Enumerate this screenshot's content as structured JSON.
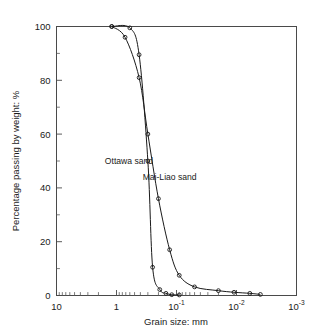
{
  "chart_data": {
    "type": "line",
    "title": "",
    "xlabel": "Grain size: mm",
    "ylabel": "Percentage passing by weight: %",
    "xscale": "log",
    "x_axis_direction": "decreasing",
    "xlim": [
      10,
      0.001
    ],
    "ylim": [
      0,
      100
    ],
    "grid": false,
    "legend": "inline-annotations",
    "x_ticks": [
      {
        "value": 10,
        "label": "10",
        "mantissa": "10",
        "exponent": ""
      },
      {
        "value": 1,
        "label": "1",
        "mantissa": "1",
        "exponent": ""
      },
      {
        "value": 0.1,
        "label": "10-1",
        "mantissa": "10",
        "exponent": "-1"
      },
      {
        "value": 0.01,
        "label": "10-2",
        "mantissa": "10",
        "exponent": "-2"
      },
      {
        "value": 0.001,
        "label": "10-3",
        "mantissa": "10",
        "exponent": "-3"
      }
    ],
    "y_ticks": [
      {
        "value": 0,
        "label": "0"
      },
      {
        "value": 20,
        "label": "20"
      },
      {
        "value": 40,
        "label": "40"
      },
      {
        "value": 60,
        "label": "60"
      },
      {
        "value": 80,
        "label": "80"
      },
      {
        "value": 100,
        "label": "100"
      }
    ],
    "y_minor_ticks": [
      10,
      30,
      50,
      70,
      90
    ],
    "series": [
      {
        "name": "Ottawa sand",
        "label": "Ottawa sand",
        "label_x": 0.62,
        "label_y": 49,
        "marker": "circle",
        "points": [
          {
            "x": 1.2,
            "y": 100
          },
          {
            "x": 0.6,
            "y": 99.5
          },
          {
            "x": 0.42,
            "y": 89.5
          },
          {
            "x": 0.3,
            "y": 50
          },
          {
            "x": 0.25,
            "y": 10.5
          },
          {
            "x": 0.19,
            "y": 2.2
          },
          {
            "x": 0.15,
            "y": 0.8
          },
          {
            "x": 0.12,
            "y": 0.3
          },
          {
            "x": 0.09,
            "y": 0.2
          }
        ]
      },
      {
        "name": "Mai-Liao sand",
        "label": "Mai-Liao sand",
        "label_x": 0.13,
        "label_y": 43,
        "marker": "circle",
        "points": [
          {
            "x": 1.2,
            "y": 100
          },
          {
            "x": 0.72,
            "y": 96
          },
          {
            "x": 0.42,
            "y": 81
          },
          {
            "x": 0.3,
            "y": 60
          },
          {
            "x": 0.2,
            "y": 36
          },
          {
            "x": 0.13,
            "y": 17
          },
          {
            "x": 0.09,
            "y": 7.5
          },
          {
            "x": 0.05,
            "y": 3.2
          },
          {
            "x": 0.02,
            "y": 1.8
          },
          {
            "x": 0.011,
            "y": 1.2
          },
          {
            "x": 0.006,
            "y": 0.8
          },
          {
            "x": 0.004,
            "y": 0.4
          }
        ]
      }
    ]
  },
  "figure": {
    "background_color": "#ffffff",
    "axis_color": "#4a4a4a",
    "curve_color": "#1a1a1a"
  }
}
